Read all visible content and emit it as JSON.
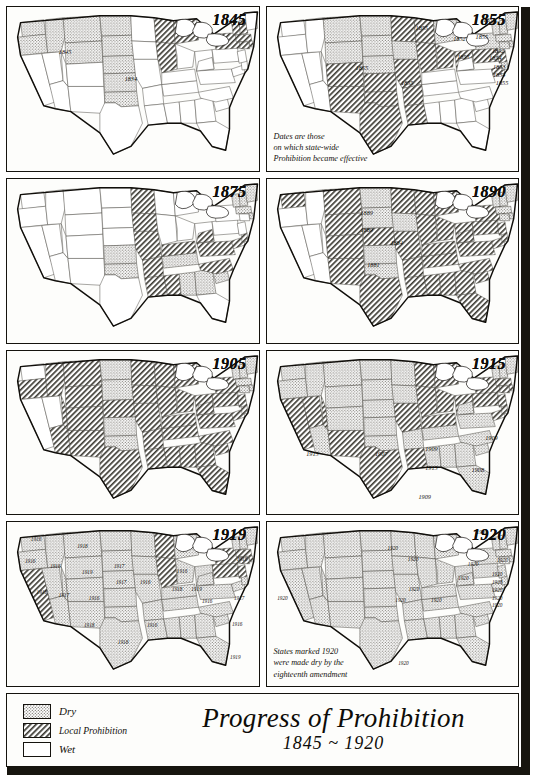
{
  "title": {
    "main": "Progress of Prohibition",
    "sub": "1845 ~ 1920"
  },
  "legend": {
    "items": [
      {
        "key": "dry",
        "label": "Dry",
        "pattern": "stipple"
      },
      {
        "key": "local",
        "label": "Local Prohibition",
        "pattern": "hatch"
      },
      {
        "key": "wet",
        "label": "Wet",
        "pattern": "plain"
      }
    ]
  },
  "panels": [
    {
      "year": "1845",
      "note": "",
      "labels": [
        {
          "text": "1845",
          "x": 60,
          "y": 46
        },
        {
          "text": "1834",
          "x": 128,
          "y": 74
        }
      ]
    },
    {
      "year": "1855",
      "note": "Dates are those\non which state-wide\nProhibition became effective",
      "labels": [
        {
          "text": "1855",
          "x": 98,
          "y": 63
        },
        {
          "text": "1855",
          "x": 145,
          "y": 79
        },
        {
          "text": "1855",
          "x": 160,
          "y": 22
        },
        {
          "text": "1851",
          "x": 230,
          "y": 13
        },
        {
          "text": "1852",
          "x": 199,
          "y": 33
        },
        {
          "text": "1855",
          "x": 222,
          "y": 31
        },
        {
          "text": "1852",
          "x": 239,
          "y": 45
        },
        {
          "text": "1855",
          "x": 203,
          "y": 52
        },
        {
          "text": "1854",
          "x": 236,
          "y": 53
        },
        {
          "text": "1853",
          "x": 240,
          "y": 62
        },
        {
          "text": "1854",
          "x": 240,
          "y": 70
        },
        {
          "text": "1855",
          "x": 243,
          "y": 79
        }
      ]
    },
    {
      "year": "1875",
      "note": "",
      "labels": []
    },
    {
      "year": "1890",
      "note": "",
      "labels": [
        {
          "text": "1889",
          "x": 103,
          "y": 35
        },
        {
          "text": "1889",
          "x": 103,
          "y": 53
        },
        {
          "text": "1884",
          "x": 134,
          "y": 66
        },
        {
          "text": "1881",
          "x": 110,
          "y": 89
        }
      ]
    },
    {
      "year": "1905",
      "note": "",
      "labels": []
    },
    {
      "year": "1915",
      "note": "",
      "labels": [
        {
          "text": "1915",
          "x": 47,
          "y": 106
        },
        {
          "text": "1907",
          "x": 118,
          "y": 106
        },
        {
          "text": "1909",
          "x": 170,
          "y": 101
        },
        {
          "text": "1915",
          "x": 170,
          "y": 121
        },
        {
          "text": "1909",
          "x": 163,
          "y": 151
        },
        {
          "text": "1908",
          "x": 218,
          "y": 123
        },
        {
          "text": "1909",
          "x": 232,
          "y": 90
        }
      ]
    },
    {
      "year": "1919",
      "note": "",
      "labels": [
        {
          "text": "1916",
          "x": 30,
          "y": 17
        },
        {
          "text": "1916",
          "x": 24,
          "y": 40
        },
        {
          "text": "1916",
          "x": 50,
          "y": 45
        },
        {
          "text": "1918",
          "x": 78,
          "y": 25
        },
        {
          "text": "1919",
          "x": 83,
          "y": 52
        },
        {
          "text": "1917",
          "x": 116,
          "y": 45
        },
        {
          "text": "1918",
          "x": 36,
          "y": 72
        },
        {
          "text": "1917",
          "x": 59,
          "y": 75
        },
        {
          "text": "1916",
          "x": 90,
          "y": 79
        },
        {
          "text": "1917",
          "x": 118,
          "y": 62
        },
        {
          "text": "1916",
          "x": 143,
          "y": 62
        },
        {
          "text": "1918",
          "x": 85,
          "y": 106
        },
        {
          "text": "1918",
          "x": 120,
          "y": 124
        },
        {
          "text": "1916",
          "x": 150,
          "y": 106
        },
        {
          "text": "1916",
          "x": 181,
          "y": 51
        },
        {
          "text": "1918",
          "x": 176,
          "y": 69
        },
        {
          "text": "1919",
          "x": 196,
          "y": 69
        },
        {
          "text": "1916",
          "x": 207,
          "y": 82
        },
        {
          "text": "1917",
          "x": 240,
          "y": 78
        },
        {
          "text": "1916",
          "x": 238,
          "y": 105
        },
        {
          "text": "1919",
          "x": 236,
          "y": 140
        },
        {
          "text": "1916",
          "x": 243,
          "y": 38
        }
      ]
    },
    {
      "year": "1920",
      "note": "States marked 1920\nwere made dry by the\neighteenth amendment",
      "labels": [
        {
          "text": "1920",
          "x": 16,
          "y": 79
        },
        {
          "text": "1920",
          "x": 130,
          "y": 27
        },
        {
          "text": "1920",
          "x": 151,
          "y": 38
        },
        {
          "text": "1920",
          "x": 152,
          "y": 69
        },
        {
          "text": "1920",
          "x": 138,
          "y": 81
        },
        {
          "text": "1920",
          "x": 175,
          "y": 81
        },
        {
          "text": "1920",
          "x": 203,
          "y": 58
        },
        {
          "text": "1920",
          "x": 213,
          "y": 43
        },
        {
          "text": "1920",
          "x": 222,
          "y": 10
        },
        {
          "text": "1920",
          "x": 243,
          "y": 39
        },
        {
          "text": "1920",
          "x": 238,
          "y": 54
        },
        {
          "text": "1920",
          "x": 238,
          "y": 62
        },
        {
          "text": "1920",
          "x": 238,
          "y": 70
        },
        {
          "text": "1920",
          "x": 238,
          "y": 78
        },
        {
          "text": "1920",
          "x": 238,
          "y": 86
        },
        {
          "text": "1920",
          "x": 141,
          "y": 146
        }
      ]
    }
  ],
  "map_state_fills": {
    "1845": {
      "default": "wet",
      "dry": [
        "WA",
        "OR",
        "ID",
        "MT",
        "WY",
        "ND",
        "SD",
        "NE",
        "KS",
        "OK"
      ],
      "local": [
        "MI",
        "WI",
        "IL",
        "NY",
        "VT",
        "NH",
        "MA",
        "CT",
        "RI"
      ]
    },
    "1855": {
      "default": "wet",
      "dry": [
        "MT",
        "ND",
        "SD",
        "WY",
        "NE",
        "IA",
        "MI",
        "NY",
        "VT",
        "NH",
        "MA",
        "CT",
        "RI",
        "ME",
        "DE"
      ],
      "local": [
        "KS",
        "OK",
        "TX",
        "CO",
        "NM",
        "MO",
        "AR",
        "LA",
        "IL",
        "WI",
        "MN",
        "IN",
        "OH",
        "PA",
        "NJ",
        "MD"
      ]
    },
    "1875": {
      "default": "wet",
      "dry": [
        "KS",
        "OK",
        "ME",
        "VT",
        "NH",
        "MA",
        "RI",
        "AL",
        "GA",
        "SC",
        "TN"
      ],
      "local": [
        "MN",
        "IA",
        "MO",
        "AR",
        "LA",
        "MS",
        "NC",
        "VA",
        "WV",
        "KY",
        "MD",
        "DE"
      ]
    },
    "1890": {
      "default": "wet",
      "dry": [
        "ND",
        "SD",
        "IA",
        "KS",
        "OK",
        "ME",
        "NH",
        "VT",
        "MA",
        "RI",
        "CT"
      ],
      "local": [
        "WA",
        "MT",
        "WY",
        "NE",
        "MN",
        "WI",
        "MI",
        "IL",
        "IN",
        "OH",
        "PA",
        "NY",
        "NJ",
        "MD",
        "DE",
        "VA",
        "WV",
        "KY",
        "TN",
        "NC",
        "SC",
        "GA",
        "FL",
        "AL",
        "MS",
        "AR",
        "LA",
        "TX",
        "NM",
        "MO",
        "CO"
      ]
    },
    "1905": {
      "default": "wet",
      "dry": [
        "ND",
        "SD",
        "KS",
        "OK",
        "ME",
        "NH",
        "VT",
        "MA",
        "RI",
        "CT"
      ],
      "local": [
        "OR",
        "ID",
        "MT",
        "WY",
        "NE",
        "MN",
        "IA",
        "MO",
        "AR",
        "LA",
        "TX",
        "NM",
        "AZ",
        "WI",
        "MI",
        "IL",
        "IN",
        "OH",
        "KY",
        "TN",
        "MS",
        "AL",
        "GA",
        "FL",
        "SC",
        "NC",
        "VA",
        "WV",
        "MD",
        "DE",
        "NJ",
        "NY",
        "PA",
        "CO",
        "UT"
      ]
    },
    "1915": {
      "default": "local",
      "dry": [
        "AZ",
        "OK",
        "TN",
        "AL",
        "MS",
        "GA",
        "NC",
        "SC",
        "VA",
        "WV",
        "ME",
        "NH",
        "VT",
        "KS",
        "ND",
        "SD",
        "IA",
        "AR",
        "CO",
        "WA",
        "OR",
        "ID",
        "MT",
        "WY",
        "NE",
        "MN",
        "FL"
      ],
      "local": [
        "CA",
        "NV",
        "UT",
        "NM",
        "TX",
        "LA",
        "MO",
        "WI",
        "MI",
        "IL",
        "IN",
        "OH",
        "KY",
        "PA",
        "NY",
        "NJ",
        "MD",
        "DE",
        "MA",
        "RI",
        "CT"
      ]
    },
    "1919": {
      "default": "dry",
      "dry": [
        "WA",
        "OR",
        "ID",
        "MT",
        "WY",
        "NV",
        "UT",
        "CO",
        "AZ",
        "NM",
        "ND",
        "SD",
        "NE",
        "KS",
        "OK",
        "TX",
        "MN",
        "IA",
        "MO",
        "AR",
        "LA",
        "MS",
        "AL",
        "GA",
        "FL",
        "SC",
        "NC",
        "TN",
        "KY",
        "IN",
        "OH",
        "MI",
        "WV",
        "VA",
        "NH",
        "VT",
        "ME",
        "MD",
        "DE",
        "SD"
      ],
      "local": [
        "CA",
        "WI",
        "IL",
        "NY",
        "PA",
        "NJ",
        "MA",
        "RI",
        "CT"
      ]
    },
    "1920": {
      "default": "dry",
      "dry": [
        "ALL"
      ],
      "local": []
    }
  }
}
